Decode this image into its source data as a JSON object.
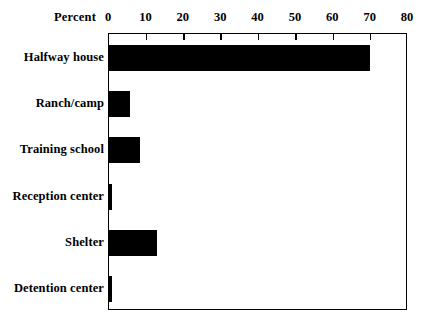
{
  "chart_data": {
    "type": "bar",
    "orientation": "horizontal",
    "title": "",
    "xlabel": "Percent",
    "ylabel": "",
    "xlim": [
      0,
      80
    ],
    "xticks": [
      0,
      10,
      20,
      30,
      40,
      50,
      60,
      70,
      80
    ],
    "xtick_labels": [
      "0",
      "10",
      "20",
      "30",
      "40",
      "50",
      "60",
      "70",
      "80"
    ],
    "grid": false,
    "legend": null,
    "axis_position": "top",
    "categories": [
      "Halfway house",
      "Ranch/camp",
      "Training school",
      "Reception center",
      "Shelter",
      "Detention center"
    ],
    "values": [
      70,
      6,
      8.5,
      1,
      13,
      1
    ],
    "bar_color": "#000000",
    "background_color": "#ffffff",
    "frame_color": "#000000"
  }
}
